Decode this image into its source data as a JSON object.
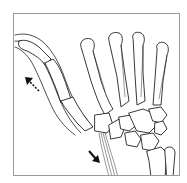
{
  "figure": {
    "view": "thumb abduction illustration",
    "arrows": [
      {
        "name": "arrow-up-left",
        "direction": "up-left",
        "style": "dotted-tail"
      },
      {
        "name": "arrow-down-right",
        "direction": "down-right",
        "style": "solid"
      }
    ],
    "colors": {
      "line": "#222222",
      "frame": "#9a9a9a",
      "background": "#ffffff"
    }
  }
}
